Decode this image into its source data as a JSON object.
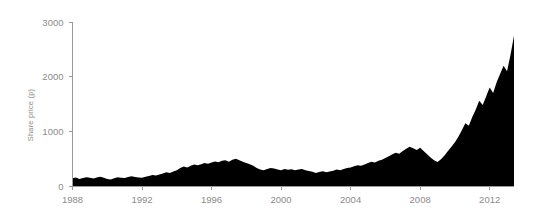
{
  "chart_data": {
    "type": "area",
    "title": "",
    "subtitle": "",
    "xlabel": "",
    "ylabel": "Share price (p)",
    "xlim": [
      1988,
      2013.4
    ],
    "ylim": [
      0,
      3000
    ],
    "grid": false,
    "legend": null,
    "series_color": "#000000",
    "axis_color": "#9a9a9a",
    "label_color": "#8b8b8b",
    "background": "#ffffff",
    "x_ticks": [
      1988,
      1992,
      1996,
      2000,
      2004,
      2008,
      2012
    ],
    "x_tick_labels": [
      "1988",
      "1992",
      "1996",
      "2000",
      "2004",
      "2008",
      "2012"
    ],
    "y_ticks": [
      0,
      1000,
      2000,
      3000
    ],
    "y_tick_labels": [
      "0",
      "1000",
      "2000",
      "3000"
    ],
    "x": [
      1988.0,
      1988.2,
      1988.4,
      1988.6,
      1988.8,
      1989.0,
      1989.2,
      1989.4,
      1989.6,
      1989.8,
      1990.0,
      1990.2,
      1990.4,
      1990.6,
      1990.8,
      1991.0,
      1991.2,
      1991.4,
      1991.6,
      1991.8,
      1992.0,
      1992.2,
      1992.4,
      1992.6,
      1992.8,
      1993.0,
      1993.2,
      1993.4,
      1993.6,
      1993.8,
      1994.0,
      1994.2,
      1994.4,
      1994.6,
      1994.8,
      1995.0,
      1995.2,
      1995.4,
      1995.6,
      1995.8,
      1996.0,
      1996.2,
      1996.4,
      1996.6,
      1996.8,
      1997.0,
      1997.2,
      1997.4,
      1997.6,
      1997.8,
      1998.0,
      1998.2,
      1998.4,
      1998.6,
      1998.8,
      1999.0,
      1999.2,
      1999.4,
      1999.6,
      1999.8,
      2000.0,
      2000.2,
      2000.4,
      2000.6,
      2000.8,
      2001.0,
      2001.2,
      2001.4,
      2001.6,
      2001.8,
      2002.0,
      2002.2,
      2002.4,
      2002.6,
      2002.8,
      2003.0,
      2003.2,
      2003.4,
      2003.6,
      2003.8,
      2004.0,
      2004.2,
      2004.4,
      2004.6,
      2004.8,
      2005.0,
      2005.2,
      2005.4,
      2005.6,
      2005.8,
      2006.0,
      2006.2,
      2006.4,
      2006.6,
      2006.8,
      2007.0,
      2007.2,
      2007.4,
      2007.6,
      2007.8,
      2008.0,
      2008.2,
      2008.4,
      2008.6,
      2008.8,
      2009.0,
      2009.2,
      2009.4,
      2009.6,
      2009.8,
      2010.0,
      2010.2,
      2010.4,
      2010.6,
      2010.8,
      2011.0,
      2011.2,
      2011.4,
      2011.6,
      2011.8,
      2012.0,
      2012.2,
      2012.4,
      2012.6,
      2012.8,
      2013.0,
      2013.2,
      2013.4
    ],
    "values": [
      140,
      155,
      130,
      145,
      160,
      150,
      135,
      155,
      170,
      150,
      130,
      120,
      140,
      160,
      150,
      145,
      165,
      180,
      165,
      155,
      150,
      170,
      185,
      200,
      190,
      210,
      230,
      250,
      240,
      265,
      290,
      330,
      355,
      340,
      370,
      395,
      380,
      400,
      420,
      405,
      430,
      450,
      435,
      460,
      470,
      445,
      480,
      500,
      470,
      445,
      420,
      400,
      370,
      330,
      300,
      290,
      310,
      330,
      320,
      300,
      290,
      310,
      295,
      305,
      290,
      300,
      310,
      290,
      275,
      260,
      240,
      255,
      270,
      250,
      265,
      280,
      300,
      290,
      310,
      330,
      340,
      360,
      380,
      370,
      395,
      420,
      445,
      430,
      460,
      480,
      510,
      545,
      580,
      610,
      590,
      640,
      680,
      720,
      690,
      660,
      700,
      640,
      580,
      520,
      470,
      440,
      490,
      560,
      640,
      720,
      800,
      900,
      1020,
      1150,
      1100,
      1260,
      1400,
      1560,
      1480,
      1640,
      1800,
      1700,
      1900,
      2050,
      2200,
      2100,
      2400,
      2750
    ]
  },
  "axis": {
    "y_title": "Share price (p)"
  }
}
